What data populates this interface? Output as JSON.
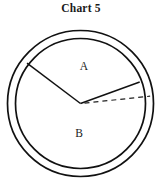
{
  "title": "Chart 5",
  "chart_data": {
    "type": "pie",
    "title": "Chart 5",
    "subtitle": "",
    "xlabel": "",
    "ylabel": "",
    "categories": [
      "A",
      "B"
    ],
    "values": [
      137,
      223
    ],
    "value_unit": "degrees",
    "labels": [
      "A",
      "B"
    ],
    "legend": [],
    "legend_position": "none",
    "grid": false,
    "annotations": [
      {
        "name": "reference-line",
        "style": "dashed",
        "from": "center",
        "to": "right-edge",
        "angle_deg": 0,
        "label": ""
      }
    ],
    "geometry": {
      "center_x": 80,
      "center_y": 103,
      "outer_radius": 73,
      "inner_radius": 65,
      "ring": true,
      "sector_a_start_deg": 20,
      "sector_a_end_deg": 143,
      "stroke_color": "#111111",
      "fill_color": "#ffffff",
      "background_color": "#ffffff"
    }
  },
  "elements": {
    "outer_circle_name": "outer-circle",
    "inner_circle_name": "inner-circle",
    "radius_left_name": "radius-left",
    "radius_right_name": "radius-right",
    "dashed_line_name": "dashed-reference-line",
    "label_a": "A",
    "label_b": "B"
  },
  "colors": {
    "stroke": "#111111",
    "text": "#1a1a1a",
    "background": "#ffffff"
  }
}
